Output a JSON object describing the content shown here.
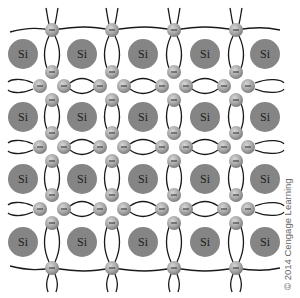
{
  "diagram": {
    "atom_label": "Si",
    "electron_symbol": "−",
    "atom_color": "#858585",
    "electron_color": "#a8a8a8",
    "bond_color": "#1a1a1a",
    "atom_columns_x": [
      23,
      82,
      143,
      205,
      265
    ],
    "atom_rows_y": [
      54,
      117,
      179,
      242
    ],
    "bond_columns_x": [
      52,
      112,
      174,
      236
    ],
    "bond_rows_y": [
      86,
      147,
      209
    ],
    "top_edge_y": 30,
    "bottom_edge_y": 268,
    "atom_count": 20
  },
  "copyright": "© 2014 Cengage Learning"
}
